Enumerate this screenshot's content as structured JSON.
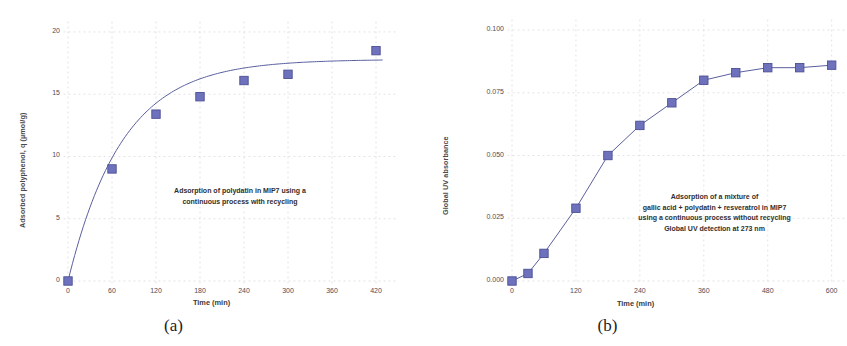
{
  "figure": {
    "background": "#ffffff",
    "marker_color": "#6e72bd",
    "marker_edge_color": "#4c4f96",
    "line_color": "#5a5f9e",
    "grid_color": "#d9d9de",
    "text_color": "#3d3d3d"
  },
  "panels": [
    {
      "id": "a",
      "caption": "(a)"
    },
    {
      "id": "b",
      "caption": "(b)"
    }
  ],
  "chart_data": [
    {
      "type": "scatter",
      "panel": "a",
      "title": "",
      "annotation": "Adsorption of polydatin in MIP7 using a\ncontinuous process with recycling",
      "xlabel": "Time (min)",
      "ylabel": "Adsorbed polyphenol, q (µmol/g)",
      "xlim": [
        0,
        450
      ],
      "ylim": [
        0,
        20.8
      ],
      "xticks": [
        0,
        60,
        120,
        180,
        240,
        300,
        360,
        420
      ],
      "xticklabels": [
        "0",
        "60",
        "120",
        "180",
        "240",
        "300",
        "360",
        "420"
      ],
      "yticks": [
        0,
        5,
        10,
        15,
        20
      ],
      "yticklabels": [
        "0",
        "5",
        "10",
        "15",
        "20"
      ],
      "grid": "dotted",
      "legend": "none",
      "x": [
        0,
        60,
        120,
        180,
        240,
        300,
        420
      ],
      "values": [
        0.0,
        9.0,
        13.4,
        14.8,
        16.1,
        16.6,
        18.5
      ],
      "fit_curve": {
        "description": "saturation curve q = qmax*(1-exp(-k*t))",
        "qmax": 17.8,
        "k": 0.0135
      }
    },
    {
      "type": "scatter",
      "panel": "b",
      "title": "",
      "annotation": "Adsorption of a mixture of\ngallic acid + polydatin + resveratrol in MIP7\nusing a continuous process without recycling\nGlobal UV detection at 273 nm",
      "xlabel": "Time (min)",
      "ylabel": "Global UV absorbance",
      "xlim": [
        0,
        625
      ],
      "ylim": [
        0,
        0.104
      ],
      "xticks": [
        0,
        120,
        240,
        360,
        480,
        600
      ],
      "xticklabels": [
        "0",
        "120",
        "240",
        "360",
        "480",
        "600"
      ],
      "yticks": [
        0.0,
        0.025,
        0.05,
        0.075,
        0.1
      ],
      "yticklabels": [
        "0.000",
        "0.025",
        "0.050",
        "0.075",
        "0.100"
      ],
      "grid": "dotted",
      "legend": "none",
      "x": [
        0,
        30,
        60,
        120,
        180,
        240,
        300,
        360,
        420,
        480,
        540,
        600
      ],
      "values": [
        0.0,
        0.003,
        0.011,
        0.029,
        0.05,
        0.062,
        0.071,
        0.08,
        0.083,
        0.085,
        0.085,
        0.086
      ]
    }
  ]
}
